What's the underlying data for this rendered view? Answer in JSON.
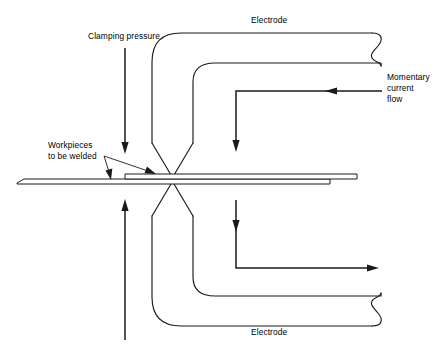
{
  "figure": {
    "background_color": "#ffffff",
    "line_color": "#1a1a1a"
  },
  "labels": {
    "electrode_top": "Electrode",
    "electrode_bottom": "Electrode",
    "clamping_pressure": "Clamping pressure",
    "momentary_current_flow": "Momentary\ncurrent\nflow",
    "workpieces": "Workpieces\nto be welded"
  },
  "annotations": {
    "clamping_arrow_down": "downward-clamping-force",
    "clamping_arrow_up": "upward-clamping-force",
    "current_arrow_upper": "current-path-upper",
    "current_arrow_lower": "current-path-lower",
    "leader_workpiece_lower": "leader-to-lower-sheet",
    "leader_workpiece_upper": "leader-to-upper-sheet"
  },
  "parts": {
    "electrode_upper_arm": "upper-electrode-arm",
    "electrode_lower_arm": "lower-electrode-arm",
    "electrode_upper_tip": "upper-electrode-tip",
    "electrode_lower_tip": "lower-electrode-tip",
    "workpiece_upper_sheet": "upper-sheet",
    "workpiece_lower_sheet": "lower-sheet"
  }
}
